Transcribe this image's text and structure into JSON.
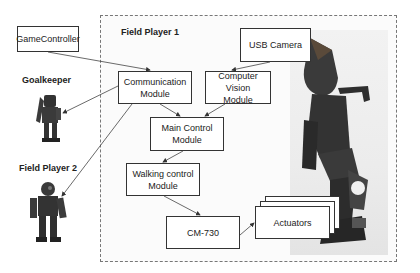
{
  "diagram": {
    "frame_title": "Field Player 1",
    "external": {
      "game_controller": "GameController",
      "goalkeeper": "Goalkeeper",
      "field_player_2": "Field Player 2"
    },
    "nodes": {
      "usb_camera": "USB Camera",
      "communication_line1": "Communication",
      "communication_line2": "Module",
      "vision_line1": "Computer Vision",
      "vision_line2": "Module",
      "main_line1": "Main Control",
      "main_line2": "Module",
      "walking_line1": "Walking control",
      "walking_line2": "Module",
      "cm730": "CM-730",
      "actuators": "Actuators"
    },
    "edges": [
      {
        "from": "GameController",
        "to": "Communication Module"
      },
      {
        "from": "Communication Module",
        "to": "Goalkeeper"
      },
      {
        "from": "Communication Module",
        "to": "Field Player 2"
      },
      {
        "from": "USB Camera",
        "to": "Computer Vision Module"
      },
      {
        "from": "Communication Module",
        "to": "Main Control Module"
      },
      {
        "from": "Computer Vision Module",
        "to": "Main Control Module"
      },
      {
        "from": "Main Control Module",
        "to": "Walking control Module"
      },
      {
        "from": "Walking control Module",
        "to": "CM-730"
      },
      {
        "from": "CM-730",
        "to": "Actuators"
      }
    ]
  }
}
